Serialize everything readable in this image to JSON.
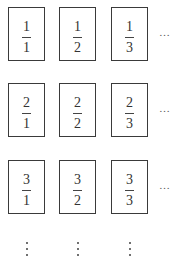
{
  "diagram": {
    "rows": [
      {
        "cells": [
          {
            "numerator": "1",
            "denominator": "1"
          },
          {
            "numerator": "1",
            "denominator": "2"
          },
          {
            "numerator": "1",
            "denominator": "3"
          }
        ],
        "continuation": "…"
      },
      {
        "cells": [
          {
            "numerator": "2",
            "denominator": "1"
          },
          {
            "numerator": "2",
            "denominator": "2"
          },
          {
            "numerator": "2",
            "denominator": "3"
          }
        ],
        "continuation": "…"
      },
      {
        "cells": [
          {
            "numerator": "3",
            "denominator": "1"
          },
          {
            "numerator": "3",
            "denominator": "2"
          },
          {
            "numerator": "3",
            "denominator": "3"
          }
        ],
        "continuation": "…"
      }
    ],
    "column_continuation": "⋮",
    "colors": {
      "border": "#3a3a3a",
      "text": "#333333",
      "background": "#ffffff"
    }
  }
}
